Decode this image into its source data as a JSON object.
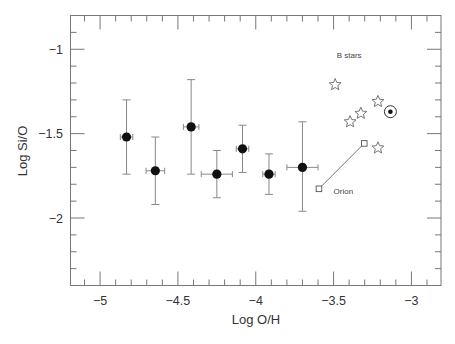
{
  "chart_data": {
    "type": "scatter",
    "title": "",
    "xlabel": "Log O/H",
    "ylabel": "Log Si/O",
    "xlim": [
      -5.19,
      -2.81
    ],
    "ylim": [
      -2.4,
      -0.8
    ],
    "grid": false,
    "legend": null,
    "x_ticks": [
      -5,
      -4.5,
      -4,
      -3.5,
      -3
    ],
    "x_tick_labels": [
      "−5",
      "−4.5",
      "−4",
      "−3.5",
      "−3"
    ],
    "x_minor_step": 0.1,
    "y_ticks": [
      -1,
      -1.5,
      -2
    ],
    "y_tick_labels": [
      "−1",
      "−1.5",
      "−2"
    ],
    "y_minor_step": 0.1,
    "series": [
      {
        "name": "Sample (filled circles with error bars)",
        "marker": "filled-circle",
        "points": [
          {
            "x": -4.83,
            "y": -1.52,
            "xerr": 0.04,
            "y_hi": -1.3,
            "y_lo": -1.74
          },
          {
            "x": -4.645,
            "y": -1.72,
            "xerr": 0.06,
            "y_hi": -1.52,
            "y_lo": -1.92
          },
          {
            "x": -4.415,
            "y": -1.46,
            "xerr": 0.05,
            "y_hi": -1.18,
            "y_lo": -1.74
          },
          {
            "x": -4.25,
            "y": -1.74,
            "xerr": 0.1,
            "y_hi": -1.6,
            "y_lo": -1.88
          },
          {
            "x": -4.085,
            "y": -1.59,
            "xerr": 0.04,
            "y_hi": -1.45,
            "y_lo": -1.73
          },
          {
            "x": -3.915,
            "y": -1.74,
            "xerr": 0.04,
            "y_hi": -1.62,
            "y_lo": -1.86
          },
          {
            "x": -3.7,
            "y": -1.7,
            "xerr": 0.1,
            "y_hi": -1.43,
            "y_lo": -1.96
          }
        ]
      },
      {
        "name": "B stars",
        "marker": "open-star",
        "points": [
          {
            "x": -3.49,
            "y": -1.21
          },
          {
            "x": -3.215,
            "y": -1.31
          },
          {
            "x": -3.325,
            "y": -1.38
          },
          {
            "x": -3.394,
            "y": -1.43
          },
          {
            "x": -3.215,
            "y": -1.585
          }
        ]
      },
      {
        "name": "Orion",
        "marker": "open-square-connected",
        "points": [
          {
            "x": -3.594,
            "y": -1.827
          },
          {
            "x": -3.303,
            "y": -1.558
          }
        ]
      },
      {
        "name": "Sun",
        "marker": "sun-symbol",
        "points": [
          {
            "x": -3.135,
            "y": -1.37
          }
        ]
      }
    ],
    "annotations": [
      {
        "text": "B stars",
        "x": -3.48,
        "y": -1.05
      },
      {
        "text": "Orion",
        "x": -3.5,
        "y": -1.86
      }
    ]
  }
}
